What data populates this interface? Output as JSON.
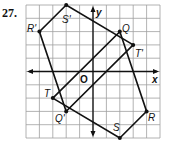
{
  "problem_number": "27.",
  "grid": {
    "cols": 10,
    "rows": 10,
    "x_min": -5,
    "x_max": 5,
    "y_min": -5,
    "y_max": 5
  },
  "axes": {
    "x_label": "x",
    "y_label": "y",
    "origin_label": "O"
  },
  "figures": [
    {
      "name": "QRST",
      "vertices": [
        {
          "label": "Q",
          "x": 2,
          "y": 3
        },
        {
          "label": "R",
          "x": 4,
          "y": -3
        },
        {
          "label": "S",
          "x": 2,
          "y": -5
        },
        {
          "label": "T",
          "x": -3,
          "y": -2
        }
      ]
    },
    {
      "name": "Q'R'S'T'",
      "vertices": [
        {
          "label": "Q'",
          "x": -2,
          "y": -3
        },
        {
          "label": "R'",
          "x": -4,
          "y": 3
        },
        {
          "label": "S'",
          "x": -2,
          "y": 5
        },
        {
          "label": "T'",
          "x": 3,
          "y": 2
        }
      ]
    }
  ],
  "labels": {
    "Q": "Q",
    "R": "R",
    "S": "S",
    "T": "T",
    "Qp": "Q'",
    "Rp": "R'",
    "Sp": "S'",
    "Tp": "T'"
  },
  "colors": {
    "grid": "#9a9a9a",
    "line": "#111111",
    "background": "#ffffff"
  }
}
